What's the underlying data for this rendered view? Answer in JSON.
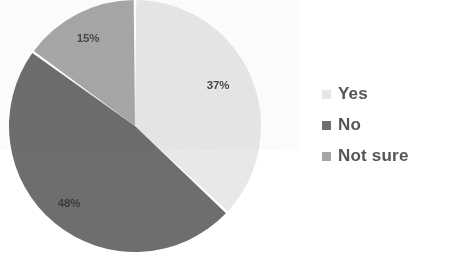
{
  "chart_data": {
    "type": "pie",
    "title": "",
    "categories": [
      "Yes",
      "No",
      "Not sure"
    ],
    "values": [
      37,
      48,
      15
    ],
    "value_labels": [
      "37%",
      "48%",
      "15%"
    ],
    "colors": [
      "#e8e8e8",
      "#6e6e6e",
      "#a8a8a8"
    ],
    "legend_position": "right",
    "start_angle_deg": 0,
    "direction": "clockwise",
    "grid": false,
    "xlabel": "",
    "ylabel": ""
  },
  "pie": {
    "slices": [
      {
        "name": "Yes",
        "label": "37%",
        "value": 37,
        "color": "#e8e8e8",
        "label_x": 218,
        "label_y": 89
      },
      {
        "name": "No",
        "label": "48%",
        "value": 48,
        "color": "#6e6e6e",
        "label_x": 69,
        "label_y": 207
      },
      {
        "name": "Not sure",
        "label": "15%",
        "value": 15,
        "color": "#a8a8a8",
        "label_x": 88,
        "label_y": 42
      }
    ]
  },
  "legend": {
    "items": [
      {
        "label": "Yes",
        "color": "#e6e6e6",
        "swatch": "square-swatch-yes"
      },
      {
        "label": "No",
        "color": "#6e6e6e",
        "swatch": "square-swatch-no"
      },
      {
        "label": "Not sure",
        "color": "#a6a6a6",
        "swatch": "square-swatch-not-sure"
      }
    ]
  }
}
